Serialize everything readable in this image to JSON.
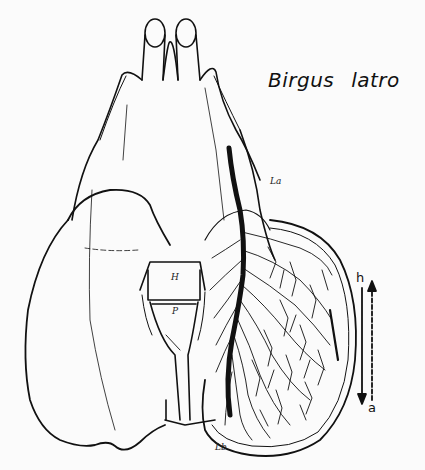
{
  "figure": {
    "title": "Birgus latro",
    "labels": {
      "upper_lung": "La",
      "lower_lung": "Lb",
      "heart": "H",
      "pericardium": "P"
    },
    "flow_arrows": {
      "down_label": "h",
      "up_label": "a"
    },
    "colors": {
      "ink": "#111111",
      "paper": "#fbfbfb",
      "bleed_through": "#e9e9e9"
    }
  }
}
